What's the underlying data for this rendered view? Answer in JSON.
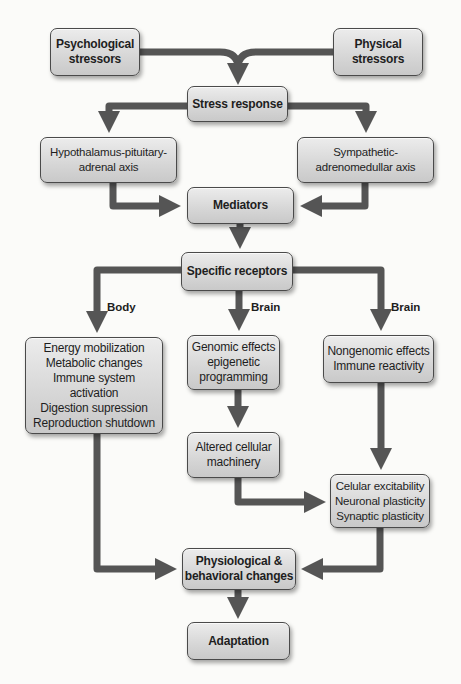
{
  "diagram": {
    "nodes": {
      "psychological": {
        "lines": [
          "Psychological",
          "stressors"
        ]
      },
      "physical": {
        "lines": [
          "Physical",
          "stressors"
        ]
      },
      "stress_response": {
        "lines": [
          "Stress response"
        ]
      },
      "hpa": {
        "lines": [
          "Hypothalamus-pituitary-",
          "adrenal axis"
        ]
      },
      "sympathetic": {
        "lines": [
          "Sympathetic-",
          "adrenomedullar axis"
        ]
      },
      "mediators": {
        "lines": [
          "Mediators"
        ]
      },
      "receptors": {
        "lines": [
          "Specific receptors"
        ]
      },
      "body_effects": {
        "lines": [
          "Energy mobilization",
          "Metabolic changes",
          "Immune system",
          "activation",
          "Digestion supression",
          "Reproduction shutdown"
        ]
      },
      "genomic": {
        "lines": [
          "Genomic effects",
          "epigenetic",
          "programming"
        ]
      },
      "nongenomic": {
        "lines": [
          "Nongenomic effects",
          "Immune reactivity"
        ]
      },
      "altered": {
        "lines": [
          "Altered cellular",
          "machinery"
        ]
      },
      "excitability": {
        "lines": [
          "Celular excitability",
          "Neuronal plasticity",
          "Synaptic plasticity"
        ]
      },
      "physiological": {
        "lines": [
          "Physiological &",
          "behavioral changes"
        ]
      },
      "adaptation": {
        "lines": [
          "Adaptation"
        ]
      }
    },
    "branch_labels": {
      "body": "Body",
      "brain_center": "Brain",
      "brain_right": "Brain"
    },
    "colors": {
      "arrow": "#555555",
      "box_fill": "#d6d6d6",
      "box_border": "#4a4a4a",
      "text": "#1e1e1e"
    }
  }
}
